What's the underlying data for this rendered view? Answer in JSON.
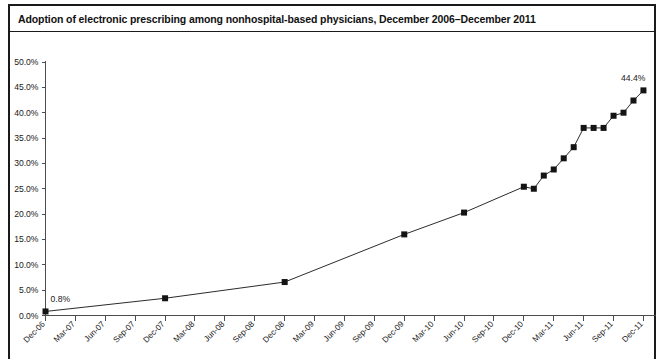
{
  "chart_data": {
    "type": "line",
    "title": "Adoption of electronic prescribing among nonhospital-based physicians, December 2006–December 2011",
    "xlabel": "",
    "ylabel": "",
    "ylim": [
      0,
      50
    ],
    "ytick_labels": [
      "0.0%",
      "5.0%",
      "10.0%",
      "15.0%",
      "20.0%",
      "25.0%",
      "30.0%",
      "35.0%",
      "40.0%",
      "45.0%",
      "50.0%"
    ],
    "ytick_values": [
      0,
      5,
      10,
      15,
      20,
      25,
      30,
      35,
      40,
      45,
      50
    ],
    "xtick_labels": [
      "Dec-06",
      "Mar-07",
      "Jun-07",
      "Sep-07",
      "Dec-07",
      "Mar-08",
      "Jun-08",
      "Sep-08",
      "Dec-08",
      "Mar-09",
      "Jun-09",
      "Sep-09",
      "Dec-09",
      "Mar-10",
      "Jun-10",
      "Sep-10",
      "Dec-10",
      "Mar-11",
      "Jun-11",
      "Sep-11",
      "Dec-11"
    ],
    "grid": false,
    "legend": null,
    "marker": "square",
    "x": [
      "Dec-06",
      "Dec-07",
      "Dec-08",
      "Dec-09",
      "Jun-10",
      "Dec-10",
      "Jan-11",
      "Feb-11",
      "Mar-11",
      "Apr-11",
      "May-11",
      "Jun-11",
      "Jul-11",
      "Aug-11",
      "Sep-11",
      "Oct-11",
      "Nov-11",
      "Dec-11"
    ],
    "values": [
      0.8,
      3.4,
      6.6,
      16.0,
      20.3,
      25.4,
      25.0,
      27.6,
      28.8,
      31.0,
      33.2,
      37.0,
      37.0,
      37.0,
      39.4,
      40.0,
      42.4,
      44.4
    ],
    "annotations": [
      {
        "label": "0.8%",
        "x": "Dec-06",
        "y": 0.8,
        "position": "above-right"
      },
      {
        "label": "44.4%",
        "x": "Dec-11",
        "y": 44.4,
        "position": "above-left"
      }
    ]
  }
}
